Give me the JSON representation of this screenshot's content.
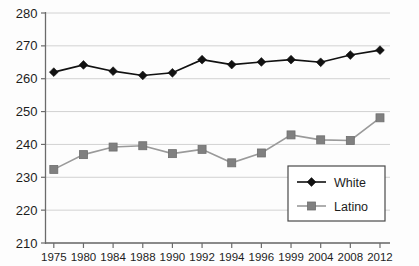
{
  "chart_data": {
    "type": "line",
    "title": "",
    "subtitle": "",
    "xlabel": "",
    "ylabel": "",
    "xlim_labels": [
      "1975",
      "2012"
    ],
    "ylim": [
      210,
      280
    ],
    "y_ticks": [
      210,
      220,
      230,
      240,
      250,
      260,
      270,
      280
    ],
    "y_tick_labels": [
      "210",
      "220",
      "230",
      "240",
      "250",
      "260",
      "270",
      "280"
    ],
    "grid": true,
    "grid_axis": "y",
    "legend_position": "lower-right",
    "categories": [
      "1975",
      "1980",
      "1984",
      "1988",
      "1990",
      "1992",
      "1994",
      "1996",
      "1999",
      "2004",
      "2008",
      "2012"
    ],
    "series": [
      {
        "name": "White",
        "marker": "diamond",
        "color": "#111111",
        "values": [
          262.0,
          264.2,
          262.3,
          261.0,
          261.8,
          265.8,
          264.3,
          265.1,
          265.8,
          265.0,
          267.2,
          268.7
        ]
      },
      {
        "name": "Latino",
        "marker": "square",
        "color": "#808080",
        "values": [
          232.4,
          236.9,
          239.2,
          239.6,
          237.2,
          238.5,
          234.4,
          237.4,
          242.9,
          241.4,
          241.2,
          248.1
        ]
      }
    ]
  },
  "legend": {
    "entries": [
      {
        "label": "White",
        "marker": "diamond-icon",
        "color": "#111111"
      },
      {
        "label": "Latino",
        "marker": "square-icon",
        "color": "#808080"
      }
    ]
  },
  "colors": {
    "white_series": "#111111",
    "latino_series": "#808080",
    "gridline": "#d2d2d2",
    "axis": "#6b6b6b",
    "background": "#fdfdfd",
    "text": "#1d1d1d"
  }
}
